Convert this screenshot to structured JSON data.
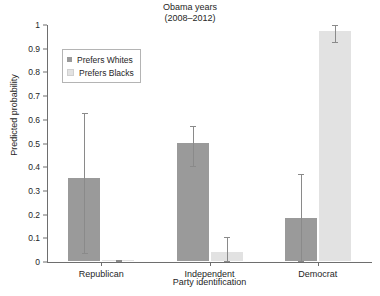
{
  "chart_data": {
    "type": "bar",
    "title": "Obama years\n(2008–2012)",
    "title_line1": "Obama years",
    "title_line2": "(2008–2012)",
    "xlabel": "Party identification",
    "ylabel": "Predicted probability",
    "categories": [
      "Republican",
      "Independent",
      "Democrat"
    ],
    "ylim": [
      0,
      1
    ],
    "yticks": [
      0,
      0.1,
      0.2,
      0.3,
      0.4,
      0.5,
      0.6,
      0.7,
      0.8,
      0.9,
      1
    ],
    "ytick_labels": [
      "0",
      "0.1",
      "0.2",
      "0.3",
      "0.4",
      "0.5",
      "0.6",
      "0.7",
      "0.8",
      "0.9",
      "1"
    ],
    "grid": false,
    "legend_position": "upper left",
    "series": [
      {
        "name": "Prefers Whites",
        "color": "#9a9a9a",
        "values": [
          0.35,
          0.5,
          0.18
        ],
        "ci_low": [
          0.035,
          0.4,
          0.0
        ],
        "ci_high": [
          0.63,
          0.575,
          0.37
        ]
      },
      {
        "name": "Prefers Blacks",
        "color": "#e2e2e2",
        "values": [
          0.005,
          0.04,
          0.97
        ],
        "ci_low": [
          0.0,
          0.0,
          0.925
        ],
        "ci_high": [
          0.01,
          0.105,
          1.0
        ]
      }
    ]
  },
  "legend": {
    "entries": [
      {
        "label": "Prefers Whites",
        "color": "#9a9a9a"
      },
      {
        "label": "Prefers Blacks",
        "color": "#e2e2e2"
      }
    ]
  },
  "colors": {
    "prefers_whites": "#9a9a9a",
    "prefers_blacks": "#e2e2e2",
    "axis": "#6e6e6e",
    "error_bar": "#8a8a8a",
    "background": "#ffffff"
  }
}
